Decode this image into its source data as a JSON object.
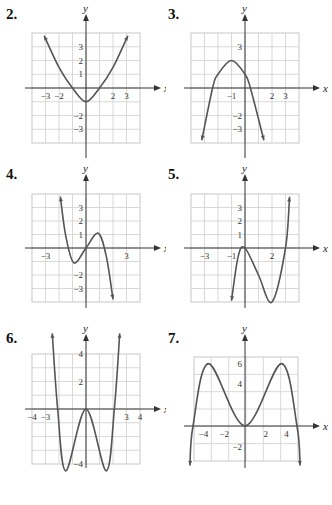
{
  "chart_data": [
    {
      "id": "2",
      "label": "2.",
      "type": "line",
      "title": "",
      "xlabel": "x",
      "ylabel": "y",
      "xlim": [
        -4,
        4
      ],
      "ylim": [
        -4,
        4
      ],
      "grid": true,
      "x_ticks": [
        "-3",
        "-2",
        "2",
        "3"
      ],
      "y_ticks": [
        "3",
        "2",
        "1",
        "-2",
        "-3"
      ],
      "function_description": "upward parabola, vertex (0,-1), x-intercepts -1 and 1",
      "x": [
        -3.1,
        -2,
        -1,
        0,
        1,
        2,
        3.1
      ],
      "y": [
        3.8,
        1.5,
        0,
        -1,
        0,
        1.5,
        3.8
      ],
      "arrows": "both ends up"
    },
    {
      "id": "3",
      "label": "3.",
      "type": "line",
      "title": "",
      "xlabel": "x",
      "ylabel": "y",
      "xlim": [
        -4,
        4
      ],
      "ylim": [
        -4,
        4
      ],
      "grid": true,
      "x_ticks": [
        "-1",
        "2",
        "3"
      ],
      "y_ticks": [
        "3",
        "-2",
        "-3"
      ],
      "function_description": "downward parabola, vertex (-1,2), x-intercepts about -2.4 and 0.4",
      "x": [
        -3.2,
        -2.4,
        -2,
        -1,
        0,
        0.4,
        1.4
      ],
      "y": [
        -3.8,
        0,
        1,
        2,
        1,
        0,
        -3.8
      ],
      "arrows": "both ends down"
    },
    {
      "id": "4",
      "label": "4.",
      "type": "line",
      "title": "",
      "xlabel": "x",
      "ylabel": "y",
      "xlim": [
        -4,
        4
      ],
      "ylim": [
        -4,
        4
      ],
      "grid": true,
      "x_ticks": [
        "-3",
        "3"
      ],
      "y_ticks": [
        "3",
        "2",
        "1",
        "-2",
        "-3"
      ],
      "function_description": "cubic: local min (-0.9,-1.1), passes origin, local max (0.9,1.1), falls right",
      "x": [
        -1.9,
        -1.5,
        -0.9,
        0,
        0.9,
        1.5,
        2.0
      ],
      "y": [
        3.8,
        0.9,
        -1.1,
        0,
        1.1,
        -0.6,
        -3.8
      ],
      "arrows": "left end up, right end down"
    },
    {
      "id": "5",
      "label": "5.",
      "type": "line",
      "title": "",
      "xlabel": "x",
      "ylabel": "y",
      "xlim": [
        -4,
        4
      ],
      "ylim": [
        -4,
        4
      ],
      "grid": true,
      "x_ticks": [
        "-3",
        "-1",
        "2"
      ],
      "y_ticks": [
        "3",
        "2",
        "1"
      ],
      "function_description": "cubic: local max at origin, local min (2,-4), crosses x-axis near 3",
      "x": [
        -1.0,
        -0.5,
        0,
        1,
        2,
        3,
        3.3
      ],
      "y": [
        -3.9,
        -0.6,
        0,
        -2,
        -4,
        0,
        3.8
      ],
      "arrows": "left end down, right end up"
    },
    {
      "id": "6",
      "label": "6.",
      "type": "line",
      "title": "",
      "xlabel": "x",
      "ylabel": "y",
      "xlim": [
        -4,
        4
      ],
      "ylim": [
        -4,
        4
      ],
      "grid": true,
      "x_ticks": [
        "-4",
        "-3",
        "3",
        "4"
      ],
      "y_ticks": [
        "4",
        "2",
        "-4"
      ],
      "function_description": "quartic W-shape: local max at origin, minima near (-1.5,-4.5) and (1.5,-4.5), x-intercepts near -2.1 and 2.1",
      "x": [
        -2.5,
        -2.1,
        -1.5,
        0,
        1.5,
        2.1,
        2.5
      ],
      "y": [
        5.5,
        0,
        -4.5,
        0,
        -4.5,
        0,
        5.5
      ],
      "arrows": "both ends up"
    },
    {
      "id": "7",
      "label": "7.",
      "type": "line",
      "title": "",
      "xlabel": "x",
      "ylabel": "y",
      "xlim": [
        -5,
        5
      ],
      "ylim": [
        -3,
        7
      ],
      "grid": true,
      "x_ticks": [
        "-4",
        "-2",
        "2",
        "4"
      ],
      "y_ticks": [
        "6",
        "4",
        "-2"
      ],
      "function_description": "quartic M-shape: maxima near (-3.5,6) and (3.5,6), local min at origin, x-intercepts near -5 and 5",
      "x": [
        -5.3,
        -5,
        -3.5,
        0,
        3.5,
        5,
        5.3
      ],
      "y": [
        -3.8,
        0,
        6,
        0,
        6,
        0,
        -3.8
      ],
      "arrows": "both ends down"
    }
  ]
}
